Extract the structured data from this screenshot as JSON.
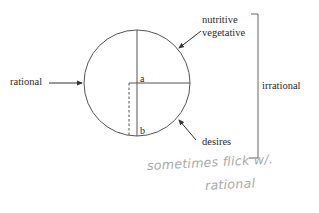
{
  "diagram": {
    "labels": {
      "rational": "rational",
      "nutritive": "nutritive",
      "vegetative": "vegetative",
      "irrational": "irrational",
      "desires": "desires",
      "point_a": "a",
      "point_b": "b"
    },
    "annotation": {
      "line1": "sometimes flick w/.",
      "line2": "rational"
    },
    "colors": {
      "line": "#555555",
      "text": "#2a2a2a",
      "handwriting": "#a9a9a9",
      "background": "#ffffff"
    }
  }
}
